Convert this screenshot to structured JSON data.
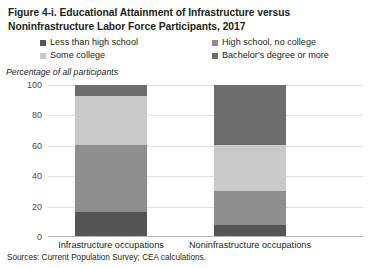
{
  "figure": {
    "title_line_1": "Figure 4-i. Educational Attainment of Infrastructure versus",
    "title_line_2": "Noninfrastructure Labor Force Participants, 2017",
    "unit_note": "Percentage of all participants",
    "source": "Sources: Current Population Survey; CEA calculations."
  },
  "colors": {
    "less_than_high_school": "#555555",
    "high_school_no_college": "#8e8e8e",
    "some_college": "#c9c9c9",
    "bachelors_or_more": "#6d6d6d",
    "gridline": "#e3e3e3",
    "axis": "#b6b6b6",
    "text": "#231f20"
  },
  "chart_data": {
    "type": "bar",
    "title": "Figure 4-i. Educational Attainment of Infrastructure versus Noninfrastructure Labor Force Participants, 2017",
    "subtitle": "",
    "stacked": true,
    "orientation": "vertical",
    "xlabel": "",
    "ylabel": "Percentage of all participants",
    "ylim": [
      0,
      100
    ],
    "yticks": [
      0,
      20,
      40,
      60,
      80,
      100
    ],
    "ytick_labels": [
      "0",
      "20",
      "40",
      "60",
      "80",
      "100"
    ],
    "grid": true,
    "legend_position": "top",
    "categories": [
      "Infrastructure occupations",
      "Noninfrastructure occupations"
    ],
    "series": [
      {
        "name": "Less than high school",
        "color": "#555555",
        "values": [
          16,
          7
        ]
      },
      {
        "name": "High school, no college",
        "color": "#8e8e8e",
        "values": [
          44,
          23
        ]
      },
      {
        "name": "Some college",
        "color": "#c9c9c9",
        "values": [
          33,
          30
        ]
      },
      {
        "name": "Bachelor's degree or more",
        "color": "#6d6d6d",
        "values": [
          7,
          40
        ]
      }
    ]
  }
}
